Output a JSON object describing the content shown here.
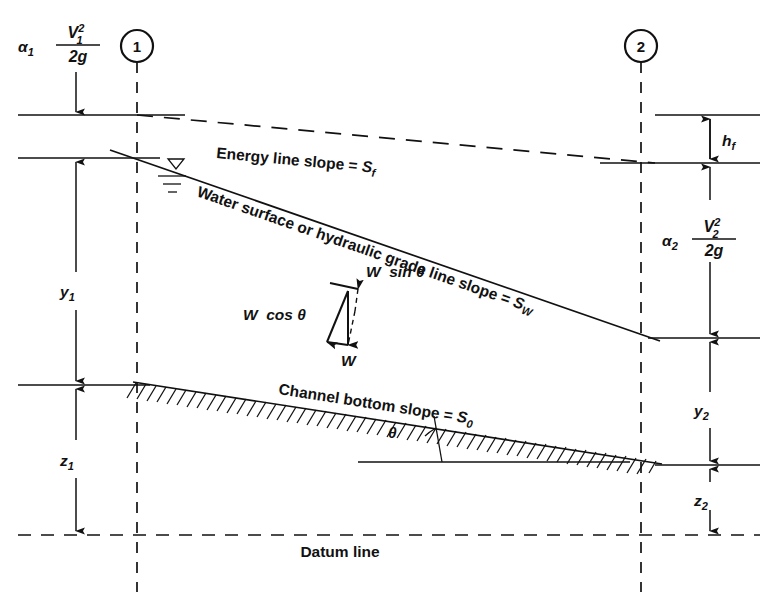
{
  "figure": {
    "background_color": "#ffffff",
    "line_color": "#111111"
  },
  "sections": [
    {
      "id": "section-1",
      "label": "1",
      "x": 137
    },
    {
      "id": "section-2",
      "label": "2",
      "x": 641
    }
  ],
  "labels": {
    "energy_line": "Energy line slope = ",
    "energy_line_symbol": "S",
    "energy_line_symbol_sub": "f",
    "water_surface": "Water surface or hydraulic grade line slope = ",
    "water_surface_symbol": "S",
    "water_surface_symbol_sub": "W",
    "channel_bottom": "Channel bottom slope = ",
    "channel_bottom_symbol": "S",
    "channel_bottom_symbol_sub": "0",
    "datum": "Datum line",
    "theta": "θ",
    "weight": "W",
    "weight_sin": "W  sin θ",
    "weight_cos": "W  cos θ"
  },
  "dimensions": {
    "velocity_head_1": {
      "alpha": "α",
      "alpha_sub": "1",
      "numerator": "V",
      "numerator_sub": "1",
      "numerator_sup": "2",
      "denominator": "2g"
    },
    "velocity_head_2": {
      "alpha": "α",
      "alpha_sub": "2",
      "numerator": "V",
      "numerator_sub": "2",
      "numerator_sup": "2",
      "denominator": "2g"
    },
    "head_loss": {
      "symbol": "h",
      "sub": "f"
    },
    "depth_1": {
      "symbol": "y",
      "sub": "1"
    },
    "depth_2": {
      "symbol": "y",
      "sub": "2"
    },
    "elevation_1": {
      "symbol": "z",
      "sub": "1"
    },
    "elevation_2": {
      "symbol": "z",
      "sub": "2"
    }
  },
  "geometry": {
    "energy_line_left_y": 115,
    "energy_line_right_y": 163,
    "water_surface_left_y": 158,
    "water_surface_right_y": 338,
    "channel_bottom_left_y": 385,
    "channel_bottom_right_y": 465,
    "datum_y": 535,
    "left_margin_x": 18,
    "right_margin_x": 760
  }
}
